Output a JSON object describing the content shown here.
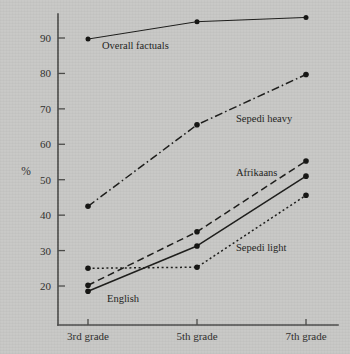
{
  "chart_data": {
    "type": "line",
    "title": "",
    "xlabel": "",
    "ylabel": "%",
    "categories": [
      "3rd grade",
      "5th grade",
      "7th grade"
    ],
    "ylim": [
      14,
      99
    ],
    "yticks": [
      20,
      30,
      40,
      50,
      60,
      70,
      80,
      90
    ],
    "ytick_labels": [
      "20",
      "30",
      "40",
      "50",
      "60",
      "70",
      "80",
      "90"
    ],
    "grid": false,
    "legend": "inline-labels",
    "series": [
      {
        "name": "Overall factuals",
        "label": "Overall factuals",
        "style": "solid-thin",
        "values": [
          89.7,
          94.6,
          95.8
        ]
      },
      {
        "name": "Sepedi heavy",
        "label": "Sepedi heavy",
        "style": "dash-dot",
        "values": [
          42.5,
          65.5,
          79.7
        ]
      },
      {
        "name": "Afrikaans",
        "label": "Afrikaans",
        "style": "dashed",
        "values": [
          20.2,
          35.3,
          55.3
        ]
      },
      {
        "name": "English",
        "label": "English",
        "style": "solid",
        "values": [
          18.5,
          31.3,
          51.0
        ]
      },
      {
        "name": "Sepedi light",
        "label": "Sepedi light",
        "style": "dotted",
        "values": [
          25.0,
          25.3,
          45.6
        ]
      }
    ]
  },
  "colors": {
    "background": "#c8c8c6",
    "ink": "#1c1c1a",
    "axis": "#4a4a48"
  }
}
